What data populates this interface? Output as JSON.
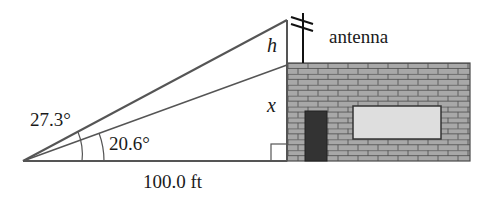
{
  "diagram": {
    "type": "trigonometry-elevation-angles",
    "labels": {
      "outer_angle": "27.3°",
      "inner_angle": "20.6°",
      "base_distance": "100.0 ft",
      "antenna_height_var": "h",
      "building_height_var": "x",
      "antenna": "antenna"
    },
    "colors": {
      "line": "#555555",
      "brick_fill": "#a8a8a8",
      "mortar": "#4a4a4a",
      "door": "#333333",
      "window": "#dedede",
      "text": "#1a1a1a"
    }
  }
}
